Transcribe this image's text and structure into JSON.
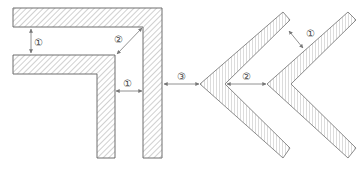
{
  "diagram": {
    "type": "technical-drawing",
    "colors": {
      "stroke": "#6e6e6e",
      "hatch": "#8a8a8a",
      "arrow": "#777777",
      "label": "#444444",
      "background": "#ffffff"
    },
    "left_figure": {
      "name": "nested-L-shapes",
      "hatch": "diagonal-45",
      "labels": [
        {
          "id": "spacing-horizontal-gap",
          "text": "①"
        },
        {
          "id": "spacing-diagonal-corner",
          "text": "②"
        },
        {
          "id": "spacing-vertical-gap",
          "text": "①"
        }
      ]
    },
    "between_figures": {
      "labels": [
        {
          "id": "spacing-between-figures",
          "text": "③"
        }
      ]
    },
    "right_figure": {
      "name": "nested-chevrons",
      "hatch": "horizontal",
      "labels": [
        {
          "id": "spacing-chevron-arm",
          "text": "①"
        },
        {
          "id": "spacing-chevron-vertex",
          "text": "②"
        }
      ]
    }
  }
}
